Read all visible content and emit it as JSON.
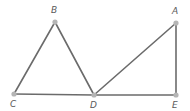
{
  "diagram": {
    "type": "geometry",
    "line_color": "#6b6b6b",
    "point_color": "#b5b5b5",
    "points": {
      "A": {
        "label": "A",
        "x": 176,
        "y": 23
      },
      "B": {
        "label": "B",
        "x": 55,
        "y": 22
      },
      "C": {
        "label": "C",
        "x": 14,
        "y": 94
      },
      "D": {
        "label": "D",
        "x": 94,
        "y": 95
      },
      "E": {
        "label": "E",
        "x": 176,
        "y": 95
      }
    },
    "segments": [
      [
        "B",
        "C"
      ],
      [
        "B",
        "D"
      ],
      [
        "C",
        "D"
      ],
      [
        "D",
        "A"
      ],
      [
        "A",
        "E"
      ],
      [
        "D",
        "E"
      ]
    ]
  }
}
